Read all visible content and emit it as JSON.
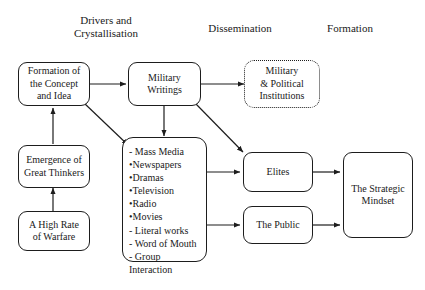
{
  "diagram": {
    "headers": [
      {
        "id": "drivers",
        "label": "Drivers and\nCrystallisation"
      },
      {
        "id": "dissemination",
        "label": "Dissemination"
      },
      {
        "id": "formation",
        "label": "Formation"
      }
    ],
    "nodes": {
      "concept": {
        "label": "Formation of\nthe Concept\nand Idea"
      },
      "military_writings": {
        "label": "Military\nWritings"
      },
      "institutions": {
        "label": "Military\n& Political\nInstitutions"
      },
      "thinkers": {
        "label": "Emergence of\nGreat Thinkers"
      },
      "warfare": {
        "label": "A High Rate\nof Warfare"
      },
      "media": {
        "label": "- Mass Media\n   •Newspapers\n   •Dramas\n   •Television\n   •Radio\n   •Movies\n- Literal works\n- Word of Mouth\n- Group Interaction"
      },
      "elites": {
        "label": "Elites"
      },
      "public": {
        "label": "The Public"
      },
      "mindset": {
        "label": "The Strategic\nMindset"
      }
    },
    "edges": [
      {
        "from": "concept",
        "to": "military_writings"
      },
      {
        "from": "military_writings",
        "to": "institutions"
      },
      {
        "from": "military_writings",
        "to": "media"
      },
      {
        "from": "military_writings",
        "to": "elites"
      },
      {
        "from": "concept",
        "to": "media"
      },
      {
        "from": "thinkers",
        "to": "concept"
      },
      {
        "from": "warfare",
        "to": "thinkers"
      },
      {
        "from": "media",
        "to": "elites"
      },
      {
        "from": "media",
        "to": "public"
      },
      {
        "from": "elites",
        "to": "mindset"
      },
      {
        "from": "public",
        "to": "mindset"
      }
    ],
    "colors": {
      "line": "#1d1d1d",
      "text": "#1a1a1a",
      "background": "#ffffff"
    }
  }
}
